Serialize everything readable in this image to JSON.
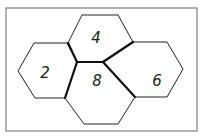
{
  "diagram": {
    "frame": {
      "x": 6,
      "y": 8,
      "width": 191,
      "height": 123,
      "stroke": "#666666"
    },
    "hexagons": [
      {
        "id": "hex-4",
        "label": "4",
        "points": "82,15 118,15 133,42 103,62 77,62 68,43",
        "label_x": 96,
        "label_y": 43
      },
      {
        "id": "hex-2",
        "label": "2",
        "points": "34,43 67,43 77,62 65,98 35,98 18,71",
        "label_x": 45,
        "label_y": 78
      },
      {
        "id": "hex-6",
        "label": "6",
        "points": "133,42 167,42 183,69 167,97 135,97 103,62",
        "label_x": 157,
        "label_y": 86
      },
      {
        "id": "hex-8",
        "label": "8",
        "points": "77,62 103,62 135,97 118,124 84,124 65,98",
        "label_x": 97,
        "label_y": 86
      }
    ],
    "thick_edges": [
      "68,43 77,62",
      "77,62 103,62",
      "103,62 133,42",
      "77,62 65,98",
      "103,62 135,97"
    ]
  }
}
